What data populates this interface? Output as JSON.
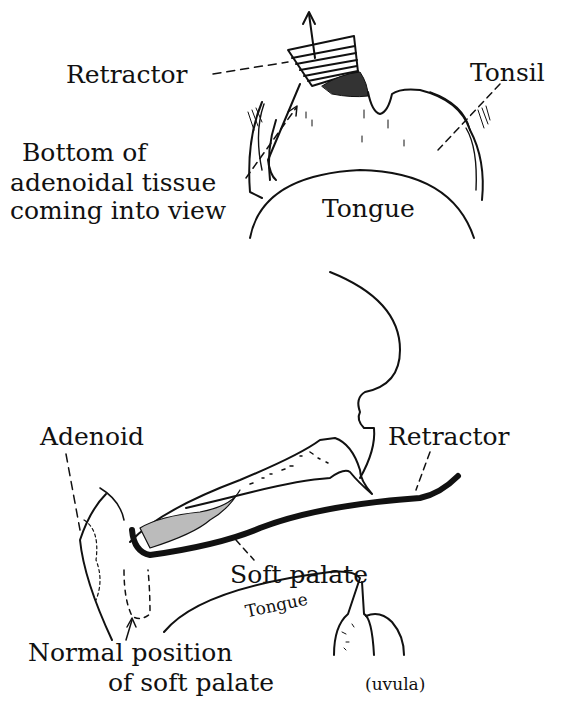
{
  "figure": {
    "top_view": {
      "labels": {
        "retractor": "Retractor",
        "tonsil": "Tonsil",
        "adenoid_line1": "Bottom of",
        "adenoid_line2": "adenoidal tissue",
        "adenoid_line3": "coming into view",
        "tongue": "Tongue"
      }
    },
    "side_view": {
      "labels": {
        "adenoid": "Adenoid",
        "retractor": "Retractor",
        "soft_palate": "Soft palate",
        "tongue": "Tongue",
        "normal_line1": "Normal position",
        "normal_line2": "of soft palate",
        "uvula": "(uvula)"
      }
    },
    "colors": {
      "ink": "#111111",
      "background": "#ffffff"
    }
  }
}
